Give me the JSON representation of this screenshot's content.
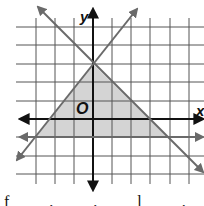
{
  "figure": {
    "type": "inequality-graph",
    "axis_labels": {
      "x": "x",
      "y": "y",
      "origin": "O"
    },
    "grid": {
      "vertical_px": [
        36,
        55,
        74,
        112,
        131,
        150,
        170,
        189
      ],
      "horizontal_px": [
        27,
        45,
        64,
        82,
        101,
        137,
        156,
        174
      ],
      "color": "#555555"
    },
    "axes": {
      "origin_px": [
        93,
        119
      ],
      "x_axis": {
        "from": [
          20,
          119
        ],
        "to": [
          203,
          119
        ]
      },
      "y_axis": {
        "from": [
          93,
          9
        ],
        "to": [
          93,
          190
        ]
      },
      "color": "#111111"
    },
    "boundary_lines": [
      {
        "name": "rising-line",
        "from": [
          17,
          160
        ],
        "to": [
          137,
          9
        ],
        "equation_grid": "through (0,3) and (-3,-1)"
      },
      {
        "name": "falling-line",
        "from": [
          38,
          7
        ],
        "to": [
          203,
          172
        ],
        "equation_grid": "y = -x + 3"
      },
      {
        "name": "horizontal-line",
        "from": [
          20,
          137
        ],
        "to": [
          203,
          137
        ],
        "equation_grid": "y = -1"
      }
    ],
    "line_color": "#6a6a6a",
    "shaded_region": {
      "vertices_px": [
        [
          36,
          137
        ],
        [
          93,
          64
        ],
        [
          167,
          137
        ]
      ],
      "vertices_grid": [
        [
          -3,
          -1
        ],
        [
          0,
          3
        ],
        [
          4,
          -1
        ]
      ],
      "fill": "#d4d4d4"
    }
  },
  "footer": {
    "fragment": "f  .  .  l  .  l"
  }
}
